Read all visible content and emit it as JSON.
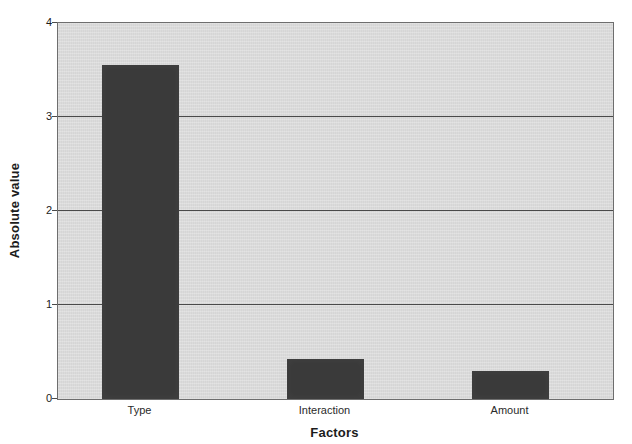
{
  "chart_data": {
    "type": "bar",
    "title": "",
    "subtitle": "",
    "categories": [
      "Type",
      "Interaction",
      "Amount"
    ],
    "values": [
      3.55,
      0.43,
      0.3
    ],
    "series": [
      {
        "name": "Absolute value",
        "values": [
          3.55,
          0.43,
          0.3
        ]
      }
    ],
    "xlabel": "Factors",
    "ylabel": "Absolute value",
    "ylim": [
      0,
      4
    ],
    "yticks": [
      0,
      1,
      2,
      3,
      4
    ],
    "ytick_labels": [
      "0",
      "1",
      "2",
      "3",
      "4"
    ],
    "gridlines": {
      "horizontal": [
        1,
        2,
        3
      ],
      "vertical": [],
      "visible": true
    },
    "legend": {
      "visible": false,
      "position": "none",
      "entries": []
    },
    "annotations": [],
    "colors": {
      "bar_fill": "#3a3a3a",
      "plot_background": "#d9d9d9",
      "figure_background": "#ffffff",
      "gridline": "#4a4a4a",
      "axis_line": "#6e6e6e",
      "text": "#1c1c1c"
    }
  }
}
